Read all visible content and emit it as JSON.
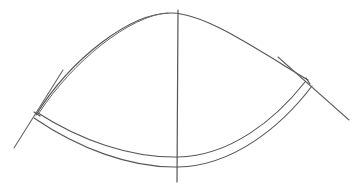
{
  "diagram": {
    "stroke_color": "#555555",
    "background": "#ffffff",
    "paths": {
      "top_arc": "M36,115 C70,60 130,12 172,13 C205,14 250,45 308,80",
      "top_arc_double": "M39,113 C72,62 130,15 168,13",
      "band_inner": "M38,113 C80,140 130,158 178,157 C230,156 275,120 305,82",
      "band_outer": "M34,118 C78,148 130,168 178,167 C232,166 280,128 312,86",
      "vertical_axis": "M178,10 L177,182",
      "left_tangent": "M14,148 L63,70",
      "right_tangent": "M278,57 L349,120",
      "left_tick": "M34,112 L40,116",
      "right_tick": "M306,78 L310,84"
    }
  }
}
